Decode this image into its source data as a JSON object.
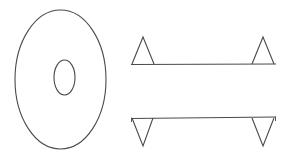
{
  "document": {
    "title": "Technical Line Drawing",
    "background_color": "#ffffff",
    "stroke_color": "#4a4a4a",
    "width": 282,
    "height": 159
  },
  "figure": {
    "views": [
      {
        "name": "front-view-disc",
        "label": "Elliptical disc with central bore",
        "outer": {
          "cx": 60.5,
          "cy": 79.5,
          "rx": 45.5,
          "ry": 69.5
        },
        "bore": {
          "cx": 64.5,
          "cy": 77.5,
          "rx": 10.5,
          "ry": 17.5
        }
      },
      {
        "name": "top-side-view-bar",
        "label": "Bar with upward triangular ends",
        "baseline_y": 64,
        "baseline_x1": 131,
        "baseline_x2": 276,
        "triangles": [
          {
            "apex_x": 143,
            "apex_y": 37,
            "left_x": 132,
            "right_x": 154
          },
          {
            "apex_x": 263,
            "apex_y": 37,
            "left_x": 252,
            "right_x": 274
          }
        ]
      },
      {
        "name": "bottom-side-view-bar",
        "label": "Bar with downward triangular ends",
        "baseline_y": 118,
        "baseline_x1": 131,
        "baseline_x2": 276,
        "triangles": [
          {
            "apex_x": 143,
            "apex_y": 146,
            "left_x": 132,
            "right_x": 153
          },
          {
            "apex_x": 263,
            "apex_y": 146,
            "left_x": 252,
            "right_x": 274
          }
        ]
      }
    ]
  },
  "colors": {
    "stroke": "#4a4a4a",
    "stroke_light": "#5a5a5a",
    "background": "#ffffff"
  }
}
